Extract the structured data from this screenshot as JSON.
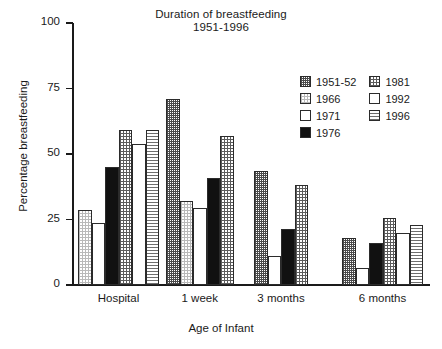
{
  "chart_data": {
    "type": "bar",
    "title": "Duration of breastfeeding",
    "subtitle": "1951-1996",
    "xlabel": "Age of Infant",
    "ylabel": "Percentage breastfeeding",
    "categories": [
      "Hospital",
      "1 week",
      "3 months",
      "6 months"
    ],
    "ylim": [
      0,
      100
    ],
    "yticks": [
      0,
      25,
      50,
      75,
      100
    ],
    "ytick_labels": [
      "0",
      "25",
      "50",
      "75",
      "100"
    ],
    "grid": false,
    "legend_position": "upper right",
    "series": [
      {
        "name": "1951-52",
        "pattern": "dark-checkerboard",
        "values": [
          null,
          71,
          43.5,
          18
        ]
      },
      {
        "name": "1966",
        "pattern": "light-stipple",
        "values": [
          28.5,
          32,
          null,
          null
        ]
      },
      {
        "name": "1971",
        "pattern": "white-empty",
        "values": [
          23.5,
          29.5,
          11,
          6.5
        ]
      },
      {
        "name": "1976",
        "pattern": "solid-black",
        "values": [
          45,
          41,
          21.5,
          16
        ]
      },
      {
        "name": "1981",
        "pattern": "fine-grid",
        "values": [
          59,
          57,
          38,
          25.5
        ]
      },
      {
        "name": "1992",
        "pattern": "white-empty",
        "values": [
          54,
          null,
          null,
          20
        ]
      },
      {
        "name": "1996",
        "pattern": "horizontal-lines",
        "values": [
          59,
          null,
          null,
          23
        ]
      }
    ]
  },
  "legend": {
    "column_left": [
      {
        "label": "1951-52",
        "pattern": "dark-checkerboard"
      },
      {
        "label": "1966",
        "pattern": "light-stipple"
      },
      {
        "label": "1971",
        "pattern": "white-empty"
      },
      {
        "label": "1976",
        "pattern": "solid-black"
      }
    ],
    "column_right": [
      {
        "label": "1981",
        "pattern": "fine-grid"
      },
      {
        "label": "1992",
        "pattern": "white-empty"
      },
      {
        "label": "1996",
        "pattern": "horizontal-lines"
      }
    ]
  },
  "colors": {
    "axis": "#1a1a1a",
    "text": "#1a1a1a",
    "background": "#ffffff",
    "bar_outline": "#2b2b2b",
    "solid_series": "#111111"
  }
}
